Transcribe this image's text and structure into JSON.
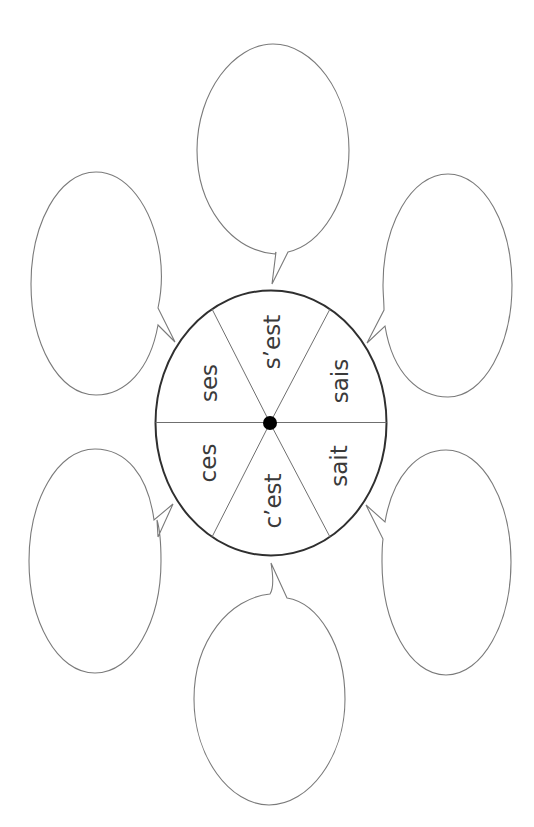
{
  "diagram": {
    "type": "word-wheel-with-speech-bubbles",
    "wheel": {
      "center": [
        270,
        423
      ],
      "segments": [
        {
          "id": "ses",
          "label": "ses",
          "pos": [
            209,
            383
          ]
        },
        {
          "id": "sest",
          "label": "s’est",
          "pos": [
            272,
            342
          ]
        },
        {
          "id": "sais",
          "label": "sais",
          "pos": [
            340,
            381
          ]
        },
        {
          "id": "ces",
          "label": "ces",
          "pos": [
            208,
            463
          ]
        },
        {
          "id": "cest",
          "label": "c’est",
          "pos": [
            273,
            501
          ]
        },
        {
          "id": "sait",
          "label": "sait",
          "pos": [
            339,
            466
          ]
        }
      ]
    },
    "bubbles": [
      {
        "id": "top",
        "text": ""
      },
      {
        "id": "top-left",
        "text": ""
      },
      {
        "id": "top-right",
        "text": ""
      },
      {
        "id": "bottom-left",
        "text": ""
      },
      {
        "id": "bottom-right",
        "text": ""
      },
      {
        "id": "bottom",
        "text": ""
      }
    ],
    "colors": {
      "wheel_stroke": "#2f2f2f",
      "bubble_stroke": "#7a7a7a",
      "label": "#3a3a3a",
      "hub": "#000000"
    }
  }
}
